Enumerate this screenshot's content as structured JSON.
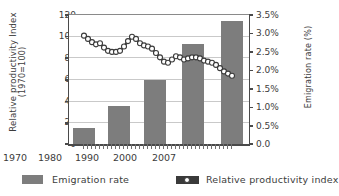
{
  "chart_data": {
    "type": "bar",
    "title": "",
    "categories": [
      "1970",
      "1980",
      "1990",
      "2000",
      "2007"
    ],
    "series": [
      {
        "name": "Emigration rate",
        "type": "bar",
        "axis": "right",
        "unit": "%",
        "values": [
          0.42,
          1.02,
          1.72,
          2.7,
          3.32
        ],
        "color": "#7d7d7d"
      },
      {
        "name": "Relative productivity index",
        "type": "line",
        "axis": "left",
        "x": [
          1970,
          1971,
          1972,
          1973,
          1974,
          1975,
          1976,
          1977,
          1978,
          1979,
          1980,
          1981,
          1982,
          1983,
          1984,
          1985,
          1986,
          1987,
          1988,
          1989,
          1990,
          1991,
          1992,
          1993,
          1994,
          1995,
          1996,
          1997,
          1998,
          1999,
          2000,
          2001,
          2002,
          2003,
          2004,
          2005,
          2006,
          2007
        ],
        "values": [
          100,
          97,
          94,
          92,
          93,
          89,
          86,
          85,
          85,
          86,
          90,
          95,
          99,
          97,
          93,
          91,
          90,
          88,
          84,
          80,
          76,
          75,
          78,
          81,
          80,
          78,
          79,
          80,
          80,
          79,
          77,
          76,
          75,
          73,
          70,
          67,
          65,
          63
        ],
        "color": "#3a3a3a",
        "marker": "white-circle"
      }
    ],
    "xlabel": "",
    "xticks": [
      "1970",
      "1980",
      "1990",
      "2000",
      "2007"
    ],
    "y_left": {
      "label": "Relative productivity Index",
      "label_line2": "(1970=100)",
      "ticks": [
        "0",
        "20",
        "40",
        "60",
        "80",
        "100",
        "120"
      ],
      "values": [
        0,
        20,
        40,
        60,
        80,
        100,
        120
      ],
      "min": 0,
      "max": 120
    },
    "y_right": {
      "label": "Emigration rate (%)",
      "ticks": [
        "0.0",
        "0.5%",
        "1.0%",
        "1.5%",
        "2.0%",
        "2.5%",
        "3.0%",
        "3.5%"
      ],
      "values": [
        0,
        0.5,
        1.0,
        1.5,
        2.0,
        2.5,
        3.0,
        3.5
      ],
      "min": 0,
      "max": 3.5
    },
    "grid": true,
    "legend_position": "bottom"
  },
  "legend": {
    "bar_label": "Emigration rate",
    "line_label": "Relative productivity index"
  }
}
